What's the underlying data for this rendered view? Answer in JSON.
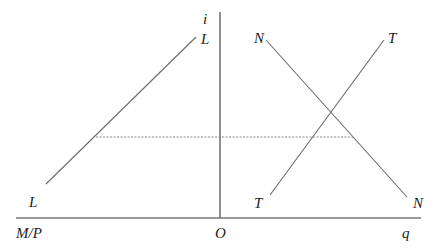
{
  "diagram": {
    "type": "economics-four-quadrant-style",
    "colors": {
      "line": "#6a6a6a",
      "axis": "#555555",
      "dashed": "#7a7a7a",
      "text": "#222222",
      "background": "#ffffff"
    },
    "axes": {
      "vertical_label": "i",
      "origin_label": "O",
      "left_label": "M/P",
      "right_label": "q"
    },
    "curves": {
      "L": {
        "top_label": "L",
        "bottom_label": "L"
      },
      "N": {
        "top_label": "N",
        "bottom_label": "N"
      },
      "T": {
        "top_label": "T",
        "bottom_label": "T"
      }
    },
    "guide": {
      "description": "dotted horizontal line at equilibrium interest rate"
    }
  }
}
